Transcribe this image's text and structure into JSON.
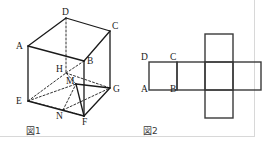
{
  "figure_panels": [
    {
      "id": "fig1",
      "caption": "図1",
      "caption_pos": {
        "x": 26,
        "y": 127
      },
      "description": "cube-with-inscribed-section",
      "vertices": {
        "A": {
          "x": 28,
          "y": 46
        },
        "B": {
          "x": 84,
          "y": 61
        },
        "C": {
          "x": 110,
          "y": 31
        },
        "D": {
          "x": 66,
          "y": 18
        },
        "E": {
          "x": 28,
          "y": 101
        },
        "F": {
          "x": 84,
          "y": 116
        },
        "G": {
          "x": 110,
          "y": 88
        },
        "H": {
          "x": 66,
          "y": 73
        },
        "M": {
          "x": 76,
          "y": 84
        },
        "N": {
          "x": 63,
          "y": 110
        }
      },
      "vertex_labels": [
        {
          "name": "A",
          "text": "A",
          "x": 16,
          "y": 42
        },
        {
          "name": "B",
          "text": "B",
          "x": 87,
          "y": 57
        },
        {
          "name": "C",
          "text": "C",
          "x": 112,
          "y": 22
        },
        {
          "name": "D",
          "text": "D",
          "x": 62,
          "y": 8
        },
        {
          "name": "E",
          "text": "E",
          "x": 16,
          "y": 97
        },
        {
          "name": "F",
          "text": "F",
          "x": 82,
          "y": 118
        },
        {
          "name": "G",
          "text": "G",
          "x": 113,
          "y": 85
        },
        {
          "name": "H",
          "text": "H",
          "x": 56,
          "y": 65
        },
        {
          "name": "M",
          "text": "M",
          "x": 66,
          "y": 77
        },
        {
          "name": "N",
          "text": "N",
          "x": 56,
          "y": 112
        }
      ],
      "solid_edges": [
        [
          "A",
          "D"
        ],
        [
          "D",
          "C"
        ],
        [
          "C",
          "G"
        ],
        [
          "A",
          "E"
        ],
        [
          "E",
          "F"
        ],
        [
          "F",
          "G"
        ],
        [
          "A",
          "B"
        ],
        [
          "B",
          "C"
        ],
        [
          "B",
          "F"
        ],
        [
          "M",
          "G"
        ],
        [
          "M",
          "F"
        ]
      ],
      "dashed_edges": [
        [
          "D",
          "H"
        ],
        [
          "E",
          "H"
        ],
        [
          "H",
          "G"
        ],
        [
          "H",
          "B"
        ],
        [
          "E",
          "M"
        ],
        [
          "E",
          "N"
        ],
        [
          "N",
          "G"
        ],
        [
          "N",
          "M"
        ],
        [
          "N",
          "F"
        ],
        [
          "M",
          "H"
        ]
      ],
      "style": {
        "stroke": "#1a1a1a",
        "solid_width": 1.3,
        "dashed_width": 0.9,
        "dash_pattern": "2,2"
      }
    },
    {
      "id": "fig2",
      "caption": "図2",
      "caption_pos": {
        "x": 143,
        "y": 127
      },
      "description": "cube-net-cross-shape",
      "cell_size": 28,
      "origin": {
        "x": 149,
        "y": 34
      },
      "cells": [
        {
          "name": "net-cell-row1-col3",
          "col": 2,
          "row": 0
        },
        {
          "name": "net-cell-row2-col1",
          "col": 0,
          "row": 1
        },
        {
          "name": "net-cell-row2-col2",
          "col": 1,
          "row": 1
        },
        {
          "name": "net-cell-row2-col3",
          "col": 2,
          "row": 1
        },
        {
          "name": "net-cell-row2-col4",
          "col": 3,
          "row": 1
        },
        {
          "name": "net-cell-row3-col3",
          "col": 2,
          "row": 2
        }
      ],
      "corner_labels": [
        {
          "name": "D",
          "text": "D",
          "x": 141,
          "y": 53
        },
        {
          "name": "C",
          "text": "C",
          "x": 170,
          "y": 53
        },
        {
          "name": "A",
          "text": "A",
          "x": 141,
          "y": 85
        },
        {
          "name": "B",
          "text": "B",
          "x": 170,
          "y": 85
        }
      ],
      "style": {
        "stroke": "#3a3a3a",
        "stroke_width": 1.4
      }
    }
  ],
  "frame": {
    "border_color": "#d8d8d8",
    "width": 255,
    "height": 137
  },
  "colors": {
    "background": "#ffffff",
    "ink": "#1a1a1a",
    "net_ink": "#3a3a3a",
    "frame": "#d8d8d8"
  }
}
